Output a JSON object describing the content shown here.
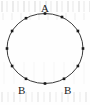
{
  "figure": {
    "type": "geometry-diagram",
    "canvas": {
      "width": 90,
      "height": 105
    },
    "background_color": "#fefefe",
    "stroke_color": "#3a3a3a",
    "point_color": "#1a1a1a",
    "label_color": "#1c1c1c"
  },
  "chart_data": {
    "type": "scatter",
    "title": "",
    "xlabel": "",
    "ylabel": "",
    "grid": false,
    "legend": null,
    "shapes": [
      {
        "kind": "circle",
        "name": "main-circle",
        "center": [
          45,
          48.5
        ],
        "radius_x": 38,
        "radius_y": 35,
        "stroke": "#3a3a3a",
        "stroke_width": 1,
        "fill": "none"
      }
    ],
    "points": [
      {
        "id": "p1",
        "clock": 12,
        "angle_deg": 90,
        "x": 45.0,
        "y": 13.5,
        "marker": "square"
      },
      {
        "id": "p2",
        "clock": 1,
        "angle_deg": 60,
        "x": 62.0,
        "y": 17.0,
        "marker": "square"
      },
      {
        "id": "p3",
        "clock": 2,
        "angle_deg": 30,
        "x": 77.9,
        "y": 31.0,
        "marker": "square"
      },
      {
        "id": "p4",
        "clock": 3,
        "angle_deg": 0,
        "x": 83.0,
        "y": 48.5,
        "marker": "square"
      },
      {
        "id": "p5",
        "clock": 4,
        "angle_deg": -30,
        "x": 77.9,
        "y": 66.0,
        "marker": "square"
      },
      {
        "id": "p6",
        "clock": 5,
        "angle_deg": -60,
        "x": 64.0,
        "y": 78.8,
        "marker": "square"
      },
      {
        "id": "p7",
        "clock": 6,
        "angle_deg": -90,
        "x": 45.0,
        "y": 83.5,
        "marker": "square"
      },
      {
        "id": "p8",
        "clock": 7,
        "angle_deg": -120,
        "x": 26.0,
        "y": 78.8,
        "marker": "square"
      },
      {
        "id": "p9",
        "clock": 8,
        "angle_deg": -150,
        "x": 12.1,
        "y": 66.0,
        "marker": "square"
      },
      {
        "id": "p10",
        "clock": 9,
        "angle_deg": 180,
        "x": 7.0,
        "y": 48.5,
        "marker": "square"
      },
      {
        "id": "p11",
        "clock": 10,
        "angle_deg": 150,
        "x": 12.1,
        "y": 31.0,
        "marker": "square"
      },
      {
        "id": "p12",
        "clock": 11,
        "angle_deg": 120,
        "x": 26.0,
        "y": 18.2,
        "marker": "square"
      }
    ],
    "annotations": [
      {
        "id": "label-a",
        "text": "A",
        "left": 41,
        "top": 3,
        "target_point": "p1"
      },
      {
        "id": "label-b-left",
        "text": "B",
        "left": 18,
        "top": 85,
        "target_point": "p8"
      },
      {
        "id": "label-b-right",
        "text": "B",
        "left": 64,
        "top": 85,
        "target_point": "p6"
      }
    ]
  }
}
